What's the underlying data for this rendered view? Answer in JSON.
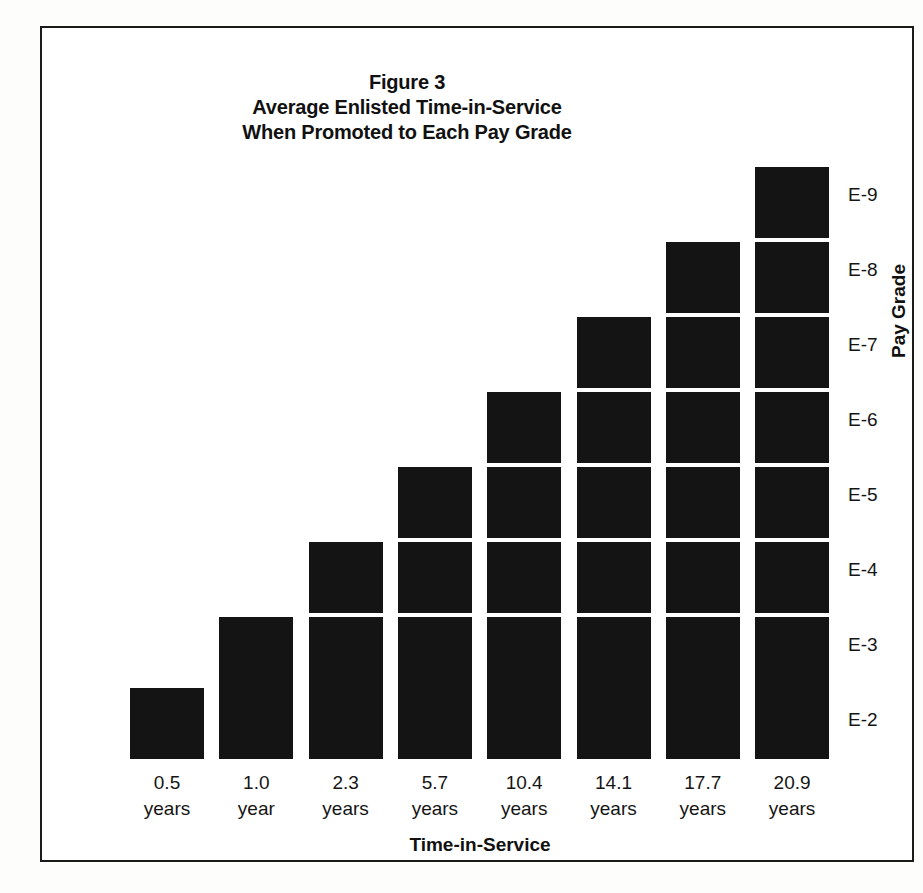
{
  "figure": {
    "title_lines": [
      "Figure 3",
      "Average Enlisted Time-in-Service",
      "When Promoted to Each Pay Grade"
    ],
    "xaxis_title": "Time-in-Service",
    "yaxis_title": "Pay Grade",
    "block_color": "#141414",
    "frame_color": "#1b1b1b",
    "background_color": "#ffffff"
  },
  "chart_data": {
    "type": "bar",
    "title": "Figure 3 Average Enlisted Time-in-Service When Promoted to Each Pay Grade",
    "subtitle": "",
    "xlabel": "Time-in-Service",
    "ylabel": "Pay Grade",
    "orientation": "vertical",
    "style": "stacked-block pictogram staircase",
    "grid": false,
    "legend": false,
    "categories": [
      "E-2",
      "E-3",
      "E-4",
      "E-5",
      "E-6",
      "E-7",
      "E-8",
      "E-9"
    ],
    "values": [
      0.5,
      1.0,
      2.3,
      5.7,
      10.4,
      14.1,
      17.7,
      20.9
    ],
    "value_units": "years",
    "block_counts": [
      1,
      2,
      3,
      4,
      5,
      6,
      7,
      8
    ],
    "x_tick_labels": [
      {
        "value": "0.5",
        "unit": "years"
      },
      {
        "value": "1.0",
        "unit": "year"
      },
      {
        "value": "2.3",
        "unit": "years"
      },
      {
        "value": "5.7",
        "unit": "years"
      },
      {
        "value": "10.4",
        "unit": "years"
      },
      {
        "value": "14.1",
        "unit": "years"
      },
      {
        "value": "17.7",
        "unit": "years"
      },
      {
        "value": "20.9",
        "unit": "years"
      }
    ],
    "y_tick_labels": [
      "E-2",
      "E-3",
      "E-4",
      "E-5",
      "E-6",
      "E-7",
      "E-8",
      "E-9"
    ],
    "ylim": [
      0,
      8
    ]
  }
}
